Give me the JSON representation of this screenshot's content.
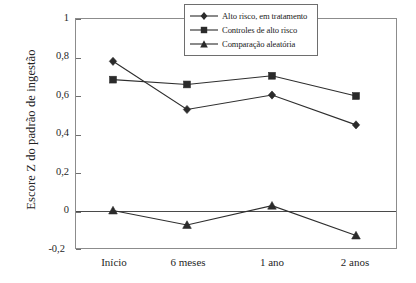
{
  "chart_data": {
    "type": "line",
    "title": "",
    "xlabel": "",
    "ylabel": "Escore Z do padrão de ingestão",
    "categories": [
      "Início",
      "6 meses",
      "1 ano",
      "2 anos"
    ],
    "ylim": [
      -0.2,
      1
    ],
    "yticks": [
      1,
      0.8,
      0.6,
      0.4,
      0.2,
      0,
      -0.2
    ],
    "ytick_labels": [
      "1",
      "0,8",
      "0,6",
      "0,4",
      "0,2",
      "0",
      "-0,2"
    ],
    "grid": false,
    "legend_position": "top-right",
    "zero_line": true,
    "series": [
      {
        "name": "Alto risco, em tratamento",
        "marker": "diamond",
        "values": [
          0.78,
          0.53,
          0.605,
          0.45
        ]
      },
      {
        "name": "Controles de alto risco",
        "marker": "square",
        "values": [
          0.685,
          0.66,
          0.705,
          0.6
        ]
      },
      {
        "name": "Comparação aleatória",
        "marker": "triangle",
        "values": [
          0.005,
          -0.07,
          0.03,
          -0.125
        ]
      }
    ]
  },
  "axis": {
    "y_title": "Escore Z do padrão de ingestão",
    "y_labels": [
      "1",
      "0,8",
      "0,6",
      "0,4",
      "0,2",
      "0",
      "-0,2"
    ],
    "x_labels": [
      "Início",
      "6 meses",
      "1 ano",
      "2 anos"
    ]
  },
  "legend": {
    "items": [
      {
        "label": "Alto risco, em tratamento",
        "marker": "diamond"
      },
      {
        "label": "Controles de alto risco",
        "marker": "square"
      },
      {
        "label": "Comparação aleatória",
        "marker": "triangle"
      }
    ]
  },
  "colors": {
    "ink": "#2b2b2b",
    "frame": "#8c8c8c",
    "background": "#ffffff"
  }
}
